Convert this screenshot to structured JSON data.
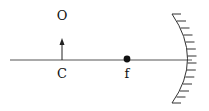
{
  "diagram": {
    "type": "concave-mirror-ray-diagram",
    "labels": {
      "object": "O",
      "center_of_curvature": "C",
      "focal_point": "f"
    },
    "elements": [
      {
        "name": "principal-axis",
        "description": "horizontal line"
      },
      {
        "name": "object-arrow",
        "description": "upward arrow at C"
      },
      {
        "name": "focal-point-dot",
        "description": "filled dot at f"
      },
      {
        "name": "concave-mirror",
        "description": "curved mirror with hatching on back side"
      }
    ],
    "colors": {
      "stroke": "#333333",
      "text": "#111111",
      "background": "#ffffff"
    }
  }
}
